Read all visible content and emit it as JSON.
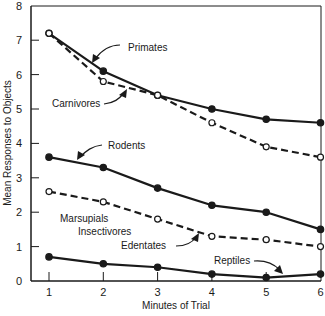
{
  "chart_data": {
    "type": "line",
    "title": "",
    "xlabel": "Minutes of Trial",
    "ylabel": "Mean Responses to Objects",
    "x": [
      1,
      2,
      3,
      4,
      5,
      6
    ],
    "xlim": [
      1,
      6
    ],
    "ylim": [
      0,
      8
    ],
    "x_ticks": [
      "1",
      "2",
      "3",
      "4",
      "5",
      "6"
    ],
    "y_ticks": [
      "0",
      "1",
      "2",
      "3",
      "4",
      "5",
      "6",
      "7",
      "8"
    ],
    "grid": false,
    "legend": "inline labels with arrows",
    "series": [
      {
        "name": "Primates",
        "style": "solid",
        "marker": "filled",
        "values": [
          7.2,
          6.1,
          5.4,
          5.0,
          4.7,
          4.6
        ]
      },
      {
        "name": "Carnivores",
        "style": "dashed",
        "marker": "open",
        "values": [
          7.2,
          5.8,
          5.4,
          4.6,
          3.9,
          3.6
        ]
      },
      {
        "name": "Rodents",
        "style": "solid",
        "marker": "filled",
        "values": [
          3.6,
          3.3,
          2.7,
          2.2,
          2.0,
          1.5
        ]
      },
      {
        "name": "Marsupials Insectivores Edentates",
        "style": "dashed",
        "marker": "open",
        "values": [
          2.6,
          2.3,
          1.8,
          1.3,
          1.2,
          1.0
        ]
      },
      {
        "name": "Reptiles",
        "style": "solid",
        "marker": "filled",
        "values": [
          0.7,
          0.5,
          0.4,
          0.2,
          0.1,
          0.2
        ]
      }
    ]
  },
  "labels": {
    "primates": "Primates",
    "carnivores": "Carnivores",
    "rodents": "Rodents",
    "marsupials": "Marsupials",
    "insectivores": "Insectivores",
    "edentates": "Edentates",
    "reptiles": "Reptiles"
  },
  "colors": {
    "ink": "#1a1a1a",
    "background": "#ffffff"
  }
}
